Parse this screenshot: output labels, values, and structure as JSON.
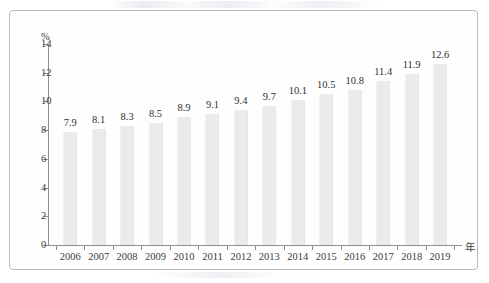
{
  "chart_data": {
    "type": "bar",
    "title": "",
    "subtitle": "",
    "xlabel": "年",
    "ylabel": "%",
    "categories": [
      "2006",
      "2007",
      "2008",
      "2009",
      "2010",
      "2011",
      "2012",
      "2013",
      "2014",
      "2015",
      "2016",
      "2017",
      "2018",
      "2019"
    ],
    "values": [
      7.9,
      8.1,
      8.3,
      8.5,
      8.9,
      9.1,
      9.4,
      9.7,
      10.1,
      10.5,
      10.8,
      11.4,
      11.9,
      12.6
    ],
    "value_labels": [
      "7.9",
      "8.1",
      "8.3",
      "8.5",
      "8.9",
      "9.1",
      "9.4",
      "9.7",
      "10.1",
      "10.5",
      "10.8",
      "11.4",
      "11.9",
      "12.6"
    ],
    "ylim": [
      0,
      14
    ],
    "ytick_values": [
      0,
      2,
      4,
      6,
      8,
      10,
      12,
      14
    ],
    "ytick_labels": [
      "0",
      "2",
      "4",
      "6",
      "8",
      "10",
      "12",
      "14"
    ],
    "grid": false,
    "legend": "none",
    "series": [
      {
        "name": "",
        "values": [
          7.9,
          8.1,
          8.3,
          8.5,
          8.9,
          9.1,
          9.4,
          9.7,
          10.1,
          10.5,
          10.8,
          11.4,
          11.9,
          12.6
        ]
      }
    ],
    "colors": {
      "bar_fill": "#ebebeb",
      "axis": "#8d8d92",
      "text": "#3c3c3c",
      "frame": "#b9b9bd",
      "background": "#fefefe"
    }
  }
}
